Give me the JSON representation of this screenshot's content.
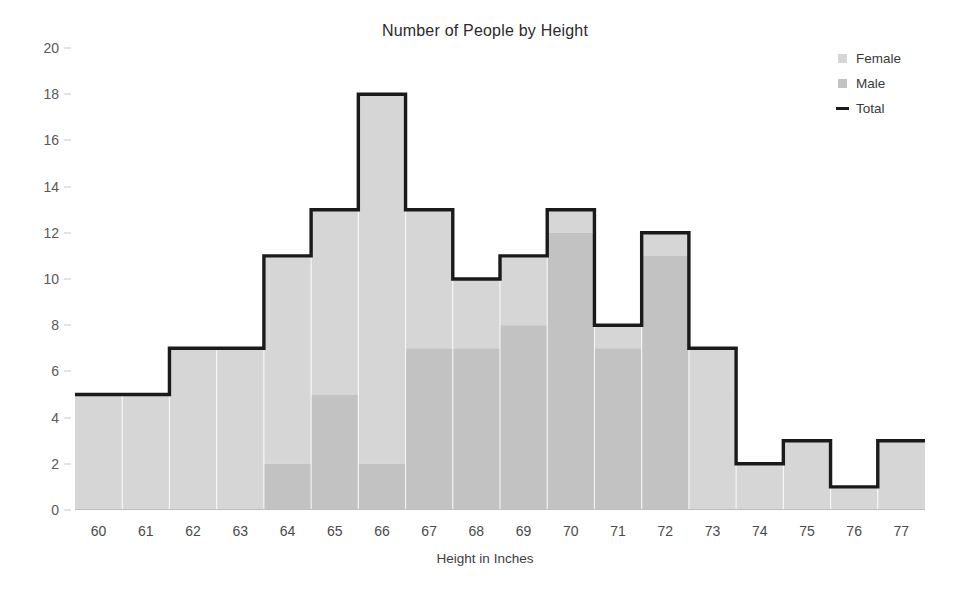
{
  "title": "Number of People by Height",
  "axes": {
    "x_title": "Height in Inches",
    "y_title": ""
  },
  "legend": {
    "items": [
      {
        "label": "Female",
        "marker": "square-swatch",
        "color": "#d6d6d6"
      },
      {
        "label": "Male",
        "marker": "square-swatch",
        "color": "#c2c2c2"
      },
      {
        "label": "Total",
        "marker": "line-swatch",
        "color": "#1a1a1a"
      }
    ]
  },
  "colors": {
    "female": "#d6d6d6",
    "male": "#c2c2c2",
    "total_line": "#1a1a1a",
    "gridline": "#ffffff",
    "tick_text": "#595959",
    "title_text": "#2b2b2b"
  },
  "chart_data": {
    "type": "bar",
    "title": "Number of People by Height",
    "xlabel": "Height in Inches",
    "ylabel": "",
    "categories": [
      60,
      61,
      62,
      63,
      64,
      65,
      66,
      67,
      68,
      69,
      70,
      71,
      72,
      73,
      74,
      75,
      76,
      77
    ],
    "xtick_labels": [
      "60",
      "61",
      "62",
      "63",
      "64",
      "65",
      "66",
      "67",
      "68",
      "69",
      "70",
      "71",
      "72",
      "73",
      "74",
      "75",
      "76",
      "77"
    ],
    "ytick_labels": [
      "0",
      "2",
      "4",
      "6",
      "8",
      "10",
      "12",
      "14",
      "16",
      "18",
      "20"
    ],
    "yticks": [
      0,
      2,
      4,
      6,
      8,
      10,
      12,
      14,
      16,
      18,
      20
    ],
    "ylim": [
      0,
      20
    ],
    "grid": "vertical-white",
    "legend_position": "top-right",
    "stacked": true,
    "series": [
      {
        "name": "Male",
        "color": "#c2c2c2",
        "values": [
          0,
          0,
          0,
          0,
          2,
          5,
          2,
          7,
          7,
          8,
          12,
          7,
          11,
          0,
          0,
          0,
          0,
          0
        ]
      },
      {
        "name": "Female",
        "color": "#d6d6d6",
        "values": [
          5,
          5,
          7,
          7,
          9,
          8,
          16,
          6,
          3,
          3,
          1,
          1,
          1,
          7,
          2,
          3,
          1,
          3
        ]
      },
      {
        "name": "Total",
        "type": "step-line",
        "color": "#1a1a1a",
        "values": [
          5,
          5,
          7,
          7,
          11,
          13,
          18,
          13,
          10,
          11,
          13,
          8,
          12,
          7,
          2,
          3,
          1,
          3
        ]
      }
    ]
  }
}
